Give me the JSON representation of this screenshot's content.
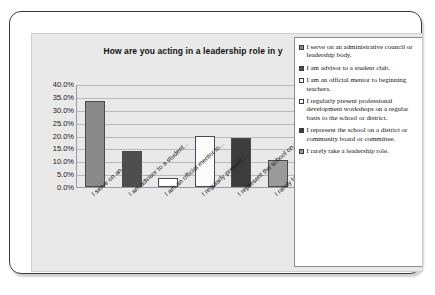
{
  "chart_data": {
    "type": "bar",
    "title": "How are you acting in a leadership role in y",
    "title_full_visible": "How are you acting in a leadership role in y",
    "xlabel": "",
    "ylabel": "",
    "ylim": [
      0,
      40
    ],
    "grid": true,
    "legend_position": "right",
    "ytick_labels": [
      "40.0%",
      "35.0%",
      "30.0%",
      "25.0%",
      "20.0%",
      "15.0%",
      "10.0%",
      "5.0%",
      "0.0%"
    ],
    "ytick_values": [
      40,
      35,
      30,
      25,
      20,
      15,
      10,
      5,
      0
    ],
    "categories": [
      "I serve on an...",
      "I am advisor to a student...",
      "I am an official mentor to...",
      "I regularly present...",
      "I represent the school on a...",
      "I rarely take a leadership..."
    ],
    "values": [
      33.3,
      13.9,
      3.4,
      20.0,
      19.1,
      10.5
    ],
    "bar_colors": [
      "#8a8a8a",
      "#4e4e4e",
      "#ffffff",
      "#fbfbfb",
      "#3c3c3c",
      "#9a9a9a"
    ],
    "legend_entries": [
      "I serve on an administrative council or leadership body.",
      "I am advisor to a student club.",
      "I am an official mentor to beginning teachers.",
      "I regularly present professional development workshops on a regular basis to the school or district.",
      "I represent the school on a district or community board or committee.",
      "I rarely take a leadership role."
    ]
  },
  "colors": {
    "frame": "#3a3a3a",
    "plot_background": "#e9e9e9",
    "gridline": "#b9b9b9",
    "axis": "#9b9b9b",
    "legend_background": "#ffffff"
  }
}
